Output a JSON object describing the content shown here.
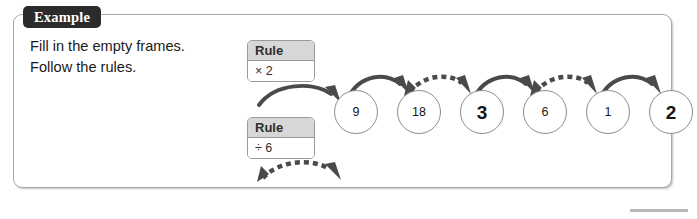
{
  "panel": {
    "tab_label": "Example"
  },
  "instructions": {
    "line1": "Fill in the empty frames.",
    "line2": "Follow the rules."
  },
  "rules": [
    {
      "id": "rule-1",
      "header": "Rule",
      "operation": "× 2",
      "arrow_style": "solid"
    },
    {
      "id": "rule-2",
      "header": "Rule",
      "operation": "÷ 6",
      "arrow_style": "dashed"
    }
  ],
  "chain": {
    "nodes": [
      {
        "value": "9",
        "kind": "given"
      },
      {
        "value": "18",
        "kind": "given"
      },
      {
        "value": "3",
        "kind": "answer"
      },
      {
        "value": "6",
        "kind": "given"
      },
      {
        "value": "1",
        "kind": "given"
      },
      {
        "value": "2",
        "kind": "answer"
      }
    ],
    "arrows": [
      "solid",
      "dashed",
      "solid",
      "dashed",
      "solid"
    ]
  },
  "colors": {
    "tab_background": "#2b2b2b",
    "tab_text": "#ffffff",
    "panel_border": "#a8a8a8",
    "rule_header_background": "#d7d7d7",
    "rule_border": "#9a9a9a",
    "node_border": "#8d8d8d",
    "arrow": "#4a4a4a",
    "text": "#1a1a1a",
    "footer_rule": "#b9b9b9"
  },
  "footer": {
    "page_rule_visible": true
  }
}
